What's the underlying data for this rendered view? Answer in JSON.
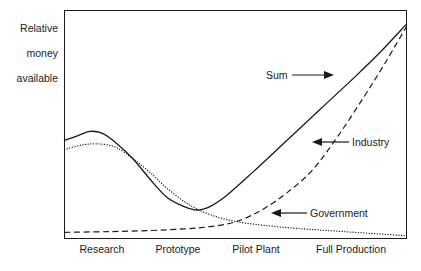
{
  "chart_data": {
    "type": "line",
    "title": "",
    "subtitle": "",
    "xlabel": "",
    "ylabel": "Relative\nmoney\navailable",
    "ylabel_lines": [
      "Relative",
      "money",
      "available"
    ],
    "categories": [
      "Research",
      "Prototype",
      "Pilot Plant",
      "Full Production"
    ],
    "xlim": [
      0,
      4
    ],
    "ylim": [
      0,
      1
    ],
    "grid": false,
    "axes_visible": {
      "left": true,
      "right": true,
      "top": true,
      "bottom": true
    },
    "tick_marks": false,
    "y_tick_labels": [],
    "legend": "inline-annotations",
    "series": [
      {
        "name": "Sum",
        "style": "solid",
        "color": "#1a1a1a",
        "points": [
          [
            0.0,
            0.43
          ],
          [
            0.15,
            0.45
          ],
          [
            0.3,
            0.47
          ],
          [
            0.45,
            0.46
          ],
          [
            0.6,
            0.42
          ],
          [
            0.8,
            0.35
          ],
          [
            1.0,
            0.26
          ],
          [
            1.2,
            0.18
          ],
          [
            1.4,
            0.14
          ],
          [
            1.55,
            0.125
          ],
          [
            1.7,
            0.14
          ],
          [
            1.9,
            0.19
          ],
          [
            2.2,
            0.29
          ],
          [
            2.6,
            0.43
          ],
          [
            3.0,
            0.57
          ],
          [
            3.4,
            0.71
          ],
          [
            3.7,
            0.82
          ],
          [
            4.0,
            0.94
          ]
        ]
      },
      {
        "name": "Industry",
        "style": "dashed",
        "color": "#1a1a1a",
        "points": [
          [
            0.0,
            0.027
          ],
          [
            0.5,
            0.03
          ],
          [
            1.0,
            0.035
          ],
          [
            1.4,
            0.042
          ],
          [
            1.7,
            0.052
          ],
          [
            1.95,
            0.068
          ],
          [
            2.15,
            0.095
          ],
          [
            2.35,
            0.135
          ],
          [
            2.6,
            0.2
          ],
          [
            2.9,
            0.3
          ],
          [
            3.2,
            0.45
          ],
          [
            3.5,
            0.62
          ],
          [
            3.75,
            0.77
          ],
          [
            4.0,
            0.93
          ]
        ]
      },
      {
        "name": "Government",
        "style": "dotted",
        "color": "#1a1a1a",
        "points": [
          [
            0.0,
            0.39
          ],
          [
            0.2,
            0.41
          ],
          [
            0.4,
            0.415
          ],
          [
            0.6,
            0.4
          ],
          [
            0.8,
            0.35
          ],
          [
            1.0,
            0.29
          ],
          [
            1.2,
            0.22
          ],
          [
            1.45,
            0.15
          ],
          [
            1.7,
            0.105
          ],
          [
            2.0,
            0.075
          ],
          [
            2.4,
            0.055
          ],
          [
            2.8,
            0.042
          ],
          [
            3.2,
            0.032
          ],
          [
            3.6,
            0.022
          ],
          [
            4.0,
            0.012
          ]
        ]
      }
    ],
    "annotations": [
      {
        "text": "Sum",
        "arrow": "right",
        "target_series": "Sum"
      },
      {
        "text": "Industry",
        "arrow": "left",
        "target_series": "Industry"
      },
      {
        "text": "Government",
        "arrow": "left",
        "target_series": "Government"
      }
    ]
  },
  "axis": {
    "y_title_line1": "Relative",
    "y_title_line2": "money",
    "y_title_line3": "available",
    "x_ticks": [
      {
        "label": "Research"
      },
      {
        "label": "Prototype"
      },
      {
        "label": "Pilot Plant"
      },
      {
        "label": "Full Production"
      }
    ]
  },
  "labels": {
    "sum": "Sum",
    "industry": "Industry",
    "government": "Government"
  },
  "colors": {
    "line": "#1a1a1a",
    "frame": "#1a1a1a",
    "background": "#ffffff"
  }
}
